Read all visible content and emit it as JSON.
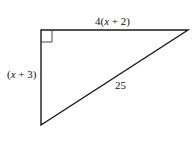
{
  "diagram": {
    "type": "right-triangle",
    "stroke_color": "#1a1a1a",
    "vertices": {
      "right_angle": [
        41,
        30
      ],
      "top_right": [
        188,
        30
      ],
      "bottom_left": [
        41,
        125
      ]
    },
    "labels": {
      "top_side": {
        "prefix": "4(",
        "var": "x",
        "suffix": " + 2)"
      },
      "left_side": {
        "prefix": "(",
        "var": "x",
        "suffix": " + 3)"
      },
      "hypotenuse": "25"
    },
    "right_angle_marker": true
  }
}
